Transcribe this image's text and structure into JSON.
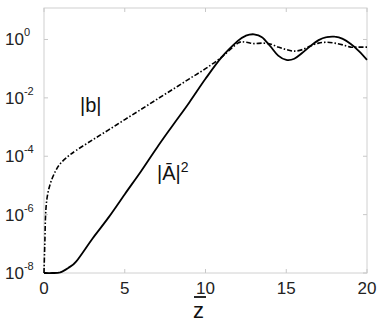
{
  "chart_data": {
    "type": "line",
    "title": "",
    "xlabel": "z̄",
    "ylabel": "",
    "yscale": "log",
    "xlim": [
      0,
      20
    ],
    "ylim": [
      1e-08,
      12
    ],
    "grid": false,
    "legend": null,
    "x_ticks": [
      0,
      5,
      10,
      15,
      20
    ],
    "x_tick_labels": [
      "0",
      "5",
      "10",
      "15",
      "20"
    ],
    "y_ticks": [
      1e-08,
      1e-06,
      0.0001,
      0.01,
      1
    ],
    "y_tick_labels": [
      {
        "base": "10",
        "exp": "-8"
      },
      {
        "base": "10",
        "exp": "-6"
      },
      {
        "base": "10",
        "exp": "-4"
      },
      {
        "base": "10",
        "exp": "-2"
      },
      {
        "base": "10",
        "exp": "0"
      }
    ],
    "annotations": [
      {
        "text": "|b|",
        "x": 3.0,
        "y": 0.0025
      },
      {
        "text": "|Ā|²",
        "x": 7.3,
        "y": 1.2e-05
      }
    ],
    "series": [
      {
        "name": "|Ā|²",
        "style": "solid",
        "color": "#000000",
        "points": [
          [
            0,
            1e-08
          ],
          [
            0.5,
            1e-08
          ],
          [
            1.0,
            1.05e-08
          ],
          [
            1.5,
            1.5e-08
          ],
          [
            2.0,
            2.5e-08
          ],
          [
            3.0,
            1.5e-07
          ],
          [
            4.0,
            8e-07
          ],
          [
            5.0,
            5e-06
          ],
          [
            6.0,
            3e-05
          ],
          [
            7.0,
            0.0002
          ],
          [
            8.0,
            0.0012
          ],
          [
            9.0,
            0.007
          ],
          [
            10.0,
            0.045
          ],
          [
            11.0,
            0.25
          ],
          [
            12.0,
            0.9
          ],
          [
            12.5,
            1.35
          ],
          [
            13.0,
            1.5
          ],
          [
            13.5,
            1.2
          ],
          [
            14.0,
            0.6
          ],
          [
            14.5,
            0.28
          ],
          [
            15.0,
            0.2
          ],
          [
            15.5,
            0.22
          ],
          [
            16.0,
            0.35
          ],
          [
            16.5,
            0.6
          ],
          [
            17.0,
            0.95
          ],
          [
            17.5,
            1.2
          ],
          [
            18.0,
            1.25
          ],
          [
            18.5,
            1.05
          ],
          [
            19.0,
            0.7
          ],
          [
            19.5,
            0.4
          ],
          [
            20.0,
            0.2
          ]
        ]
      },
      {
        "name": "|b|",
        "style": "dashdot",
        "color": "#000000",
        "points": [
          [
            0,
            1e-08
          ],
          [
            0.05,
            1e-07
          ],
          [
            0.1,
            1e-06
          ],
          [
            0.2,
            4e-06
          ],
          [
            0.4,
            1.2e-05
          ],
          [
            0.7,
            3e-05
          ],
          [
            1.0,
            5.5e-05
          ],
          [
            1.5,
            0.0001
          ],
          [
            2.0,
            0.00016
          ],
          [
            3.0,
            0.00036
          ],
          [
            4.0,
            0.0008
          ],
          [
            5.0,
            0.0018
          ],
          [
            6.0,
            0.004
          ],
          [
            7.0,
            0.009
          ],
          [
            8.0,
            0.02
          ],
          [
            9.0,
            0.045
          ],
          [
            10.0,
            0.1
          ],
          [
            11.0,
            0.25
          ],
          [
            12.0,
            0.75
          ],
          [
            12.5,
            0.8
          ],
          [
            13.0,
            0.72
          ],
          [
            13.5,
            0.75
          ],
          [
            14.0,
            0.7
          ],
          [
            14.5,
            0.55
          ],
          [
            15.0,
            0.45
          ],
          [
            15.5,
            0.4
          ],
          [
            16.0,
            0.45
          ],
          [
            16.5,
            0.6
          ],
          [
            17.0,
            0.75
          ],
          [
            17.5,
            0.8
          ],
          [
            18.0,
            0.75
          ],
          [
            18.5,
            0.65
          ],
          [
            19.0,
            0.55
          ],
          [
            19.5,
            0.55
          ],
          [
            20.0,
            0.55
          ]
        ]
      }
    ]
  },
  "plot_area": {
    "left": 44,
    "right": 367,
    "top": 8,
    "bottom": 273
  },
  "labels": {
    "b_curve": "|b|",
    "a_curve_base": "|Ā|",
    "a_curve_exp": "2",
    "x_axis": "z"
  }
}
